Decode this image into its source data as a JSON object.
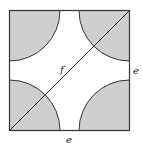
{
  "diagram": {
    "type": "square-with-quarter-circles",
    "square": {
      "x": 9.5,
      "y": 10.5,
      "size": 120
    },
    "quarter_circle_radius": 50.5,
    "colors": {
      "shade": "#cfcfcf",
      "stroke": "#333333",
      "background": "#ffffff"
    },
    "labels": {
      "diagonal": "f",
      "right_side": "e",
      "bottom_side": "e"
    }
  }
}
